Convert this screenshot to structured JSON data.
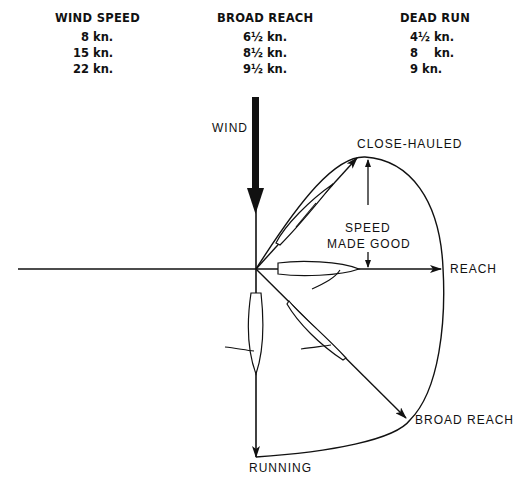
{
  "table": {
    "columns": [
      {
        "header": "WIND SPEED",
        "values": [
          "8 kn.",
          "15 kn.",
          "22 kn."
        ]
      },
      {
        "header": "BROAD REACH",
        "values": [
          "6½ kn.",
          "8½ kn.",
          "9½ kn."
        ]
      },
      {
        "header": "DEAD RUN",
        "values": [
          "4½ kn.",
          "8    kn.",
          "9 kn."
        ]
      }
    ]
  },
  "diagram": {
    "labels": {
      "wind": "WIND",
      "close_hauled": "CLOSE-HAULED",
      "speed": "SPEED",
      "made_good": "MADE GOOD",
      "reach": "REACH",
      "broad_reach": "BROAD REACH",
      "running": "RUNNING"
    }
  }
}
